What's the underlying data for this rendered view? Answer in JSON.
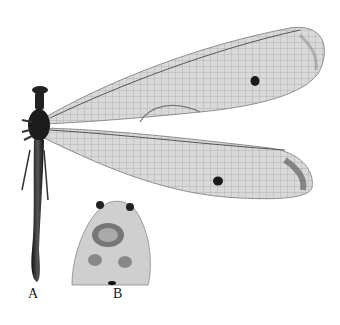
{
  "figure": {
    "panels": [
      {
        "label": "A",
        "content": "Whole specimen, dorsal view with fore and hind wings"
      },
      {
        "label": "B",
        "content": "Head / mouthparts detail"
      }
    ],
    "colors": {
      "background": "#ffffff",
      "wing_membrane": "#d8d8d8",
      "body": "#2a2a2a",
      "spot": "#1a1a1a"
    }
  }
}
